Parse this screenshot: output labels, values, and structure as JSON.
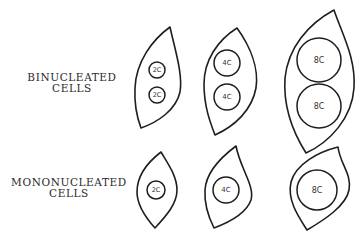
{
  "rows": [
    {
      "label_line1": "BINUCLEATED",
      "label_line2": "CELLS",
      "cells": [
        {
          "nuclei": [
            "2C",
            "2C"
          ]
        },
        {
          "nuclei": [
            "4C",
            "4C"
          ]
        },
        {
          "nuclei": [
            "8C",
            "8C"
          ]
        }
      ]
    },
    {
      "label_line1": "MONONUCLEATED",
      "label_line2": "CELLS",
      "cells": [
        {
          "nuclei": [
            "2C"
          ]
        },
        {
          "nuclei": [
            "4C"
          ]
        },
        {
          "nuclei": [
            "8C"
          ]
        }
      ]
    }
  ]
}
